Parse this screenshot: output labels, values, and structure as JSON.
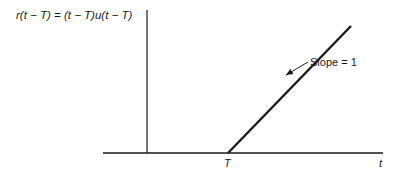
{
  "figure": {
    "function_label": "r(t − T) = (t − T)u(t − T)",
    "slope_label": "Slope = 1",
    "x_axis_label": "t",
    "shift_label": "T",
    "colors": {
      "line": "#1a1a1a",
      "background": "#ffffff"
    }
  },
  "geometry": {
    "x_axis": {
      "x1": 103,
      "y": 153,
      "x2": 383
    },
    "y_axis": {
      "x": 147,
      "y1": 10,
      "y2": 153
    },
    "ramp": {
      "x1": 228,
      "y1": 153,
      "x2": 351,
      "y2": 26
    },
    "slope_pointer": {
      "x1": 308,
      "y1": 62,
      "x2": 284,
      "y2": 76
    }
  }
}
